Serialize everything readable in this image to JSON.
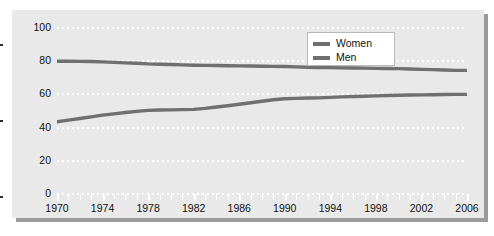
{
  "chart_data": {
    "type": "line",
    "title": "",
    "subtitle": "",
    "xlabel": "",
    "ylabel": "",
    "xlim": [
      1970,
      2006
    ],
    "ylim": [
      0,
      100
    ],
    "yticks": [
      0,
      20,
      40,
      60,
      80,
      100
    ],
    "ytick_labels": [
      "0",
      "20",
      "40",
      "60",
      "80",
      "100"
    ],
    "xticks": [
      1970,
      1974,
      1978,
      1982,
      1986,
      1990,
      1994,
      1998,
      2002,
      2006
    ],
    "xtick_labels": [
      "1970",
      "1974",
      "1978",
      "1982",
      "1986",
      "1990",
      "1994",
      "1998",
      "2002",
      "2006"
    ],
    "x_minor_interval": 1,
    "grid": "horizontal-dotted-white",
    "legend_position": "top-right",
    "legend": [
      "Women",
      "Men"
    ],
    "colors": {
      "women": "#6f6f6f",
      "men": "#6f6f6f",
      "panel_background": "#e9e9e9",
      "gridline": "#ffffff",
      "shadow": "#9a9a9a",
      "text": "#111111"
    },
    "x": [
      1970,
      1971,
      1972,
      1973,
      1974,
      1975,
      1976,
      1977,
      1978,
      1979,
      1980,
      1981,
      1982,
      1983,
      1984,
      1985,
      1986,
      1987,
      1988,
      1989,
      1990,
      1991,
      1992,
      1993,
      1994,
      1995,
      1996,
      1997,
      1998,
      1999,
      2000,
      2001,
      2002,
      2003,
      2004,
      2005,
      2006
    ],
    "series": [
      {
        "name": "Men",
        "values": [
          80.0,
          80.0,
          79.9,
          79.8,
          79.6,
          79.3,
          79.0,
          78.8,
          78.4,
          78.2,
          78.0,
          77.8,
          77.6,
          77.5,
          77.4,
          77.3,
          77.2,
          77.1,
          77.0,
          76.9,
          76.8,
          76.6,
          76.4,
          76.2,
          76.1,
          76.0,
          75.9,
          75.8,
          75.7,
          75.6,
          75.5,
          75.3,
          75.1,
          74.9,
          74.7,
          74.5,
          74.5
        ]
      },
      {
        "name": "Women",
        "values": [
          43.5,
          44.5,
          45.5,
          46.5,
          47.5,
          48.3,
          49.1,
          49.8,
          50.4,
          50.6,
          50.7,
          50.8,
          51.0,
          51.6,
          52.4,
          53.2,
          54.1,
          55.0,
          55.9,
          56.8,
          57.4,
          57.6,
          57.8,
          57.9,
          58.2,
          58.5,
          58.7,
          58.9,
          59.1,
          59.3,
          59.5,
          59.6,
          59.7,
          59.8,
          59.9,
          60.0,
          60.0
        ]
      }
    ]
  },
  "legend": {
    "items": [
      {
        "label": "Women",
        "color": "#6f6f6f"
      },
      {
        "label": "Men",
        "color": "#6f6f6f"
      }
    ]
  }
}
